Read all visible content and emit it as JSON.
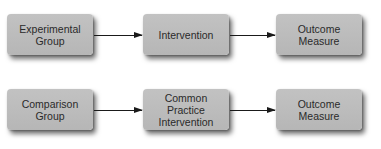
{
  "diagram": {
    "type": "flowchart",
    "rows": [
      {
        "nodes": [
          {
            "id": "experimental-group",
            "label": "Experimental\nGroup"
          },
          {
            "id": "intervention",
            "label": "Intervention"
          },
          {
            "id": "outcome-measure-1",
            "label": "Outcome\nMeasure"
          }
        ],
        "edges": [
          {
            "from": "experimental-group",
            "to": "intervention"
          },
          {
            "from": "intervention",
            "to": "outcome-measure-1"
          }
        ]
      },
      {
        "nodes": [
          {
            "id": "comparison-group",
            "label": "Comparison\nGroup"
          },
          {
            "id": "common-practice-intervention",
            "label": "Common\nPractice\nIntervention"
          },
          {
            "id": "outcome-measure-2",
            "label": "Outcome\nMeasure"
          }
        ],
        "edges": [
          {
            "from": "comparison-group",
            "to": "common-practice-intervention"
          },
          {
            "from": "common-practice-intervention",
            "to": "outcome-measure-2"
          }
        ]
      }
    ],
    "colors": {
      "box_fill": "#bcbcbc",
      "text": "#2a2a2a",
      "arrow": "#1a1a1a",
      "background": "#ffffff"
    }
  }
}
